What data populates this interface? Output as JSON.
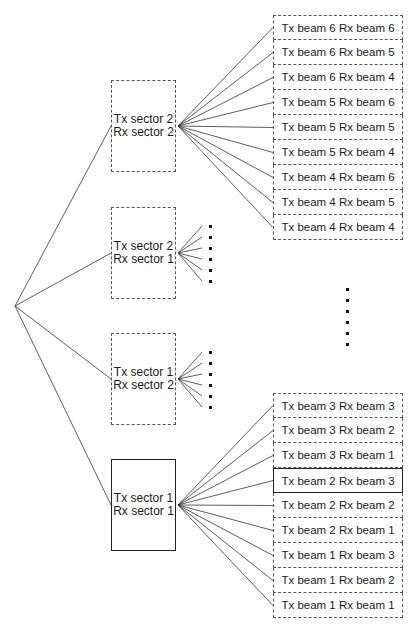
{
  "diagram": {
    "type": "tree",
    "root": {
      "x": 15,
      "y": 306
    },
    "sectors": [
      {
        "line1": "Tx sector 2",
        "line2": "Rx sector 2",
        "top": 80,
        "style": "dashed",
        "expanded": true
      },
      {
        "line1": "Tx sector 2",
        "line2": "Rx sector 1",
        "top": 207,
        "style": "dashed",
        "expanded": false
      },
      {
        "line1": "Tx sector 1",
        "line2": "Rx sector 2",
        "top": 333,
        "style": "dashed",
        "expanded": false
      },
      {
        "line1": "Tx sector 1",
        "line2": "Rx sector 1",
        "top": 459,
        "style": "solid",
        "expanded": true
      }
    ],
    "beam_groups": [
      {
        "parent": 0,
        "top": 15,
        "items": [
          {
            "label": "Tx beam 6 Rx beam 6",
            "selected": false
          },
          {
            "label": "Tx beam 6 Rx beam 5",
            "selected": false
          },
          {
            "label": "Tx beam 6 Rx beam 4",
            "selected": false
          },
          {
            "label": "Tx beam 5 Rx beam 6",
            "selected": false
          },
          {
            "label": "Tx beam 5 Rx beam 5",
            "selected": false
          },
          {
            "label": "Tx beam 5 Rx beam 4",
            "selected": false
          },
          {
            "label": "Tx beam 4 Rx beam 6",
            "selected": false
          },
          {
            "label": "Tx beam 4 Rx beam 5",
            "selected": false
          },
          {
            "label": "Tx beam 4 Rx beam 4",
            "selected": false
          }
        ]
      },
      {
        "parent": 3,
        "top": 393,
        "items": [
          {
            "label": "Tx beam 3 Rx beam 3",
            "selected": false
          },
          {
            "label": "Tx beam 3 Rx beam 2",
            "selected": false
          },
          {
            "label": "Tx beam 3 Rx beam 1",
            "selected": false
          },
          {
            "label": "Tx beam 2 Rx beam 3",
            "selected": true
          },
          {
            "label": "Tx beam 2 Rx beam 2",
            "selected": false
          },
          {
            "label": "Tx beam 2 Rx beam 1",
            "selected": false
          },
          {
            "label": "Tx beam 1 Rx beam 3",
            "selected": false
          },
          {
            "label": "Tx beam 1 Rx beam 2",
            "selected": false
          },
          {
            "label": "Tx beam 1 Rx beam 1",
            "selected": false
          }
        ]
      }
    ],
    "ellipsis_note": "vertical dots indicate omitted beam pairs"
  }
}
